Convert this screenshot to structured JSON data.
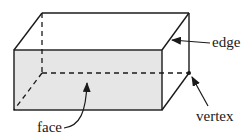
{
  "diagram": {
    "labels": {
      "edge": "edge",
      "vertex": "vertex",
      "face": "face"
    },
    "colors": {
      "stroke": "#1a1a1a",
      "front_face_fill": "#e6e6e6",
      "background": "#ffffff"
    },
    "vertices": {
      "front_top_left": [
        14,
        50
      ],
      "front_top_right": [
        162,
        50
      ],
      "front_bottom_left": [
        14,
        110
      ],
      "front_bottom_right": [
        162,
        110
      ],
      "back_top_left": [
        42,
        13
      ],
      "back_top_right": [
        189,
        13
      ],
      "back_bottom_left": [
        42,
        73
      ],
      "back_bottom_right": [
        189,
        73
      ]
    }
  }
}
